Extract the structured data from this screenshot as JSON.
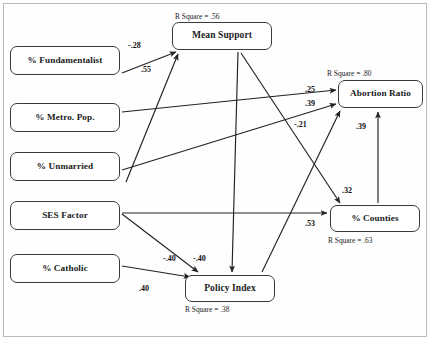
{
  "diagram": {
    "type": "path-diagram",
    "stroke_color": "#222222",
    "box_border_color": "#3a3a3a",
    "background": "#ffffff",
    "nodes": [
      {
        "id": "fundamentalist",
        "label": "% Fundamentalist",
        "x": 10,
        "y": 46,
        "w": 110,
        "h": 29,
        "font": 9.2,
        "rsquare": null
      },
      {
        "id": "metro",
        "label": "% Metro. Pop.",
        "x": 10,
        "y": 103,
        "w": 110,
        "h": 29,
        "font": 9.2,
        "rsquare": null
      },
      {
        "id": "unmarried",
        "label": "% Unmarried",
        "x": 10,
        "y": 152,
        "w": 110,
        "h": 29,
        "font": 9.2,
        "rsquare": null
      },
      {
        "id": "ses",
        "label": "SES Factor",
        "x": 10,
        "y": 201,
        "w": 110,
        "h": 29,
        "font": 9.2,
        "rsquare": null
      },
      {
        "id": "catholic",
        "label": "% Catholic",
        "x": 10,
        "y": 254,
        "w": 110,
        "h": 29,
        "font": 9.2,
        "rsquare": null
      },
      {
        "id": "meansupport",
        "label": "Mean Support",
        "x": 172,
        "y": 22,
        "w": 100,
        "h": 28,
        "font": 9.5,
        "rsquare": "R Square =  .56",
        "rsq_x": 175,
        "rsq_y": 12
      },
      {
        "id": "abortionratio",
        "label": "Abortion Ratio",
        "x": 338,
        "y": 80,
        "w": 85,
        "h": 28,
        "font": 9.2,
        "rsquare": "R Square =  .80",
        "rsq_x": 327,
        "rsq_y": 69
      },
      {
        "id": "counties",
        "label": "% Counties",
        "x": 330,
        "y": 205,
        "w": 90,
        "h": 27,
        "font": 9.2,
        "rsquare": "R Square =  .63",
        "rsq_x": 328,
        "rsq_y": 236
      },
      {
        "id": "policyindex",
        "label": "Policy Index",
        "x": 185,
        "y": 275,
        "w": 90,
        "h": 27,
        "font": 9.5,
        "rsquare": "R Square = .38",
        "rsq_x": 185,
        "rsq_y": 305
      }
    ],
    "paths": [
      {
        "id": "fund-mean",
        "from": "fundamentalist",
        "to": "meansupport",
        "coef": "-.28",
        "lx": 128,
        "ly": 41,
        "x1": 122,
        "y1": 73,
        "x2": 176,
        "y2": 52
      },
      {
        "id": "unmar-mean",
        "from": "unmarried",
        "to": "meansupport",
        "coef": ".55",
        "lx": 141,
        "ly": 65,
        "x1": 126,
        "y1": 182,
        "x2": 178,
        "y2": 54
      },
      {
        "id": "metro-abort",
        "from": "metro",
        "to": "abortionratio",
        "coef": ".25",
        "lx": 305,
        "ly": 85,
        "x1": 122,
        "y1": 112,
        "x2": 336,
        "y2": 90
      },
      {
        "id": "ses-abort",
        "from": "ses",
        "to": "abortionratio",
        "coef": ".39",
        "lx": 305,
        "ly": 99,
        "x1": 122,
        "y1": 170,
        "x2": 336,
        "y2": 104
      },
      {
        "id": "ses-counties",
        "from": "ses",
        "to": "counties",
        "coef": ".53",
        "lx": 305,
        "ly": 219,
        "x1": 122,
        "y1": 213,
        "x2": 327,
        "y2": 213
      },
      {
        "id": "ses-policy",
        "from": "ses",
        "to": "policyindex",
        "coef": "-.40",
        "lx": 163,
        "ly": 254,
        "x1": 122,
        "y1": 214,
        "x2": 198,
        "y2": 272
      },
      {
        "id": "cath-policy",
        "from": "catholic",
        "to": "policyindex",
        "coef": ".40",
        "lx": 139,
        "ly": 284,
        "x1": 122,
        "y1": 266,
        "x2": 190,
        "y2": 277
      },
      {
        "id": "mean-policy",
        "from": "meansupport",
        "to": "policyindex",
        "coef": "-.40",
        "lx": 193,
        "ly": 254,
        "x1": 238,
        "y1": 52,
        "x2": 232,
        "y2": 272
      },
      {
        "id": "mean-counties",
        "from": "meansupport",
        "to": "counties",
        "coef": ".32",
        "lx": 342,
        "ly": 186,
        "x1": 241,
        "y1": 53,
        "x2": 340,
        "y2": 203
      },
      {
        "id": "policy-abort",
        "from": "policyindex",
        "to": "abortionratio",
        "coef": "-.21",
        "lx": 294,
        "ly": 120,
        "x1": 262,
        "y1": 272,
        "x2": 340,
        "y2": 111
      },
      {
        "id": "counties-abort",
        "from": "counties",
        "to": "abortionratio",
        "coef": ".39",
        "lx": 356,
        "ly": 122,
        "x1": 378,
        "y1": 203,
        "x2": 378,
        "y2": 112
      }
    ]
  }
}
